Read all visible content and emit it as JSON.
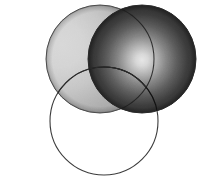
{
  "figure": {
    "title": "Three overlapping circles diagram",
    "canvas": {
      "width": 206,
      "height": 188
    },
    "background_color": "#ffffff",
    "outline_color": "#3a3a3a",
    "outline_width": 1,
    "grain": {
      "enabled": true,
      "opacity": 0.12,
      "description": "scanned paper noise texture"
    }
  },
  "chart_data": {
    "type": "scatter",
    "title": "Three overlapping circles diagram",
    "xlabel": "",
    "ylabel": "",
    "xlim": [
      0,
      206
    ],
    "ylim": [
      0,
      188
    ],
    "grid": false,
    "legend": "none",
    "shapes": [
      {
        "id": "circle-left",
        "label": "Left light sphere",
        "cx": 100,
        "cy": 59,
        "r": 54,
        "fill_style": "radial-gradient",
        "fill_center_color": "#d8d8d8",
        "fill_edge_color": "#a9a9a9",
        "highlight_x": 62,
        "highlight_y": 45,
        "stroke": "#4a4a4a",
        "filled": true
      },
      {
        "id": "circle-right",
        "label": "Right dark sphere",
        "cx": 142,
        "cy": 59,
        "r": 54,
        "fill_style": "radial-gradient",
        "fill_center_color": "#e6e6e6",
        "fill_edge_color": "#2b2b2b",
        "highlight_x": 142,
        "highlight_y": 60,
        "stroke": "#2a2a2a",
        "filled": true
      },
      {
        "id": "circle-bottom",
        "label": "Bottom outlined circle",
        "cx": 104,
        "cy": 121,
        "r": 54,
        "fill_style": "none",
        "fill_center_color": "none",
        "fill_edge_color": "none",
        "stroke": "#3a3a3a",
        "filled": false
      }
    ],
    "overlaps": [
      {
        "id": "overlap-left-right",
        "between": [
          "circle-left",
          "circle-right"
        ],
        "shading": "darker lens"
      },
      {
        "id": "overlap-left-bottom",
        "between": [
          "circle-left",
          "circle-bottom"
        ],
        "shading": "light sphere visible through transparent circle"
      },
      {
        "id": "overlap-right-bottom",
        "between": [
          "circle-right",
          "circle-bottom"
        ],
        "shading": "dark sphere visible through transparent circle"
      }
    ]
  }
}
